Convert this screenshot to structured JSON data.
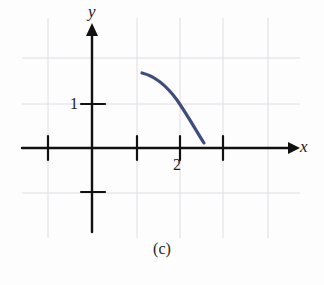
{
  "figure": {
    "caption": "(c)",
    "background_color": "#fdfdfd"
  },
  "axes": {
    "x_label": "x",
    "y_label": "y",
    "axis_color": "#111111",
    "grid_color": "#d9d6e0",
    "origin_px": {
      "x": 92,
      "y": 148
    },
    "unit_px": {
      "x": 44,
      "y": 44
    },
    "x_ticks": [
      {
        "value": -1,
        "label": "",
        "px": 48
      },
      {
        "value": 1,
        "label": "",
        "px": 137
      },
      {
        "value": 2,
        "label": "2",
        "px": 180
      },
      {
        "value": 3,
        "label": "",
        "px": 223
      }
    ],
    "y_ticks": [
      {
        "value": 1,
        "label": "1",
        "px": 104
      },
      {
        "value": -1,
        "label": "",
        "px": 192
      }
    ],
    "gridlines_vertical_px": [
      48,
      137,
      180,
      223,
      268
    ],
    "gridlines_horizontal_px": [
      58,
      104,
      148,
      193
    ],
    "x_arrow": true,
    "y_arrow": true
  },
  "chart_data": {
    "type": "line",
    "title": "",
    "subtitle": "",
    "xlabel": "x",
    "ylabel": "y",
    "xlim": [
      -1.1,
      3.9
    ],
    "ylim": [
      -1.1,
      2.1
    ],
    "grid": true,
    "legend": null,
    "annotations": [],
    "series": [
      {
        "name": "curve",
        "color": "#3f4d7d",
        "line_width": 3.2,
        "x": [
          1.14,
          1.3,
          1.47,
          1.64,
          1.8,
          1.95,
          2.1,
          2.25,
          2.34,
          2.44,
          2.52
        ],
        "y": [
          1.7,
          1.66,
          1.6,
          1.51,
          1.39,
          1.25,
          1.07,
          0.83,
          0.63,
          0.36,
          0.12
        ]
      }
    ]
  },
  "curve_path_px": "M142,73 C155,76 166,85 177,100 C188,116 197,132 204,143",
  "colors": {
    "curve": "#3f4d7d",
    "axis": "#111111",
    "grid": "#d9d6e0",
    "text": "#1c1c1c",
    "paper": "#fdfdfd"
  }
}
